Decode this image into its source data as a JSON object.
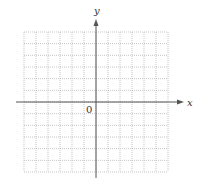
{
  "diagram": {
    "type": "coordinate-plane",
    "x_axis_label": "x",
    "y_axis_label": "y",
    "origin_label": "0",
    "grid": {
      "columns": 12,
      "rows": 12,
      "columns_left_of_origin": 6,
      "columns_right_of_origin": 6,
      "rows_above_origin": 6,
      "rows_below_origin": 6,
      "line_style": "dotted"
    },
    "colors": {
      "axis": "#555555",
      "grid": "#b8b8b8",
      "label": "#333333",
      "background": "#ffffff"
    }
  }
}
